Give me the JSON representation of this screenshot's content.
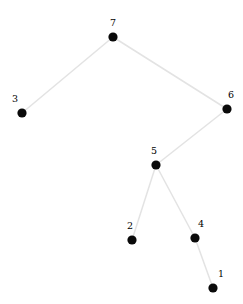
{
  "figure": {
    "kind": "graph-diagram",
    "subtitle": "binary tree node-link diagram",
    "width": 243,
    "height": 304,
    "background_color": "#ffffff",
    "node_color": "#0a0a0a",
    "edge_color": "#e3e3e3",
    "label_color": "#000000",
    "node_radius": 4.6,
    "edge_width": 1.5
  },
  "chart_data": {
    "type": "diagram",
    "title": "",
    "nodes": [
      {
        "id": "7",
        "label": "7",
        "x": 113,
        "y": 37,
        "label_x": 110,
        "label_y": 18,
        "label_anchor": "above-left"
      },
      {
        "id": "3",
        "label": "3",
        "x": 22,
        "y": 113,
        "label_x": 12,
        "label_y": 94,
        "label_anchor": "above-left"
      },
      {
        "id": "6",
        "label": "6",
        "x": 227,
        "y": 109,
        "label_x": 228,
        "label_y": 90,
        "label_anchor": "above-right"
      },
      {
        "id": "5",
        "label": "5",
        "x": 156,
        "y": 165,
        "label_x": 151,
        "label_y": 146,
        "label_anchor": "above-left"
      },
      {
        "id": "2",
        "label": "2",
        "x": 132,
        "y": 240,
        "label_x": 127,
        "label_y": 221,
        "label_anchor": "above-left"
      },
      {
        "id": "4",
        "label": "4",
        "x": 195,
        "y": 238,
        "label_x": 198,
        "label_y": 219,
        "label_anchor": "above-right"
      },
      {
        "id": "1",
        "label": "1",
        "x": 213,
        "y": 288,
        "label_x": 218,
        "label_y": 269,
        "label_anchor": "above-right"
      }
    ],
    "edges": [
      {
        "source": "7",
        "target": "3"
      },
      {
        "source": "7",
        "target": "6"
      },
      {
        "source": "6",
        "target": "5"
      },
      {
        "source": "5",
        "target": "2"
      },
      {
        "source": "5",
        "target": "4"
      },
      {
        "source": "4",
        "target": "1"
      }
    ],
    "node_labels": [
      "7",
      "3",
      "6",
      "5",
      "2",
      "4",
      "1"
    ],
    "legend": [],
    "xlabel": "",
    "ylabel": "",
    "grid": false
  }
}
